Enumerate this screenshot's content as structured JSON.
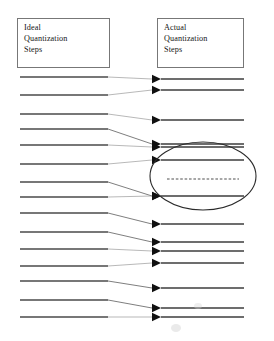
{
  "figure": {
    "width": 274,
    "height": 341,
    "background_color": "#ffffff"
  },
  "boxes": {
    "ideal": {
      "name": "Ideal Quantization Steps",
      "lines": [
        "Ideal",
        "Quantization",
        "Steps"
      ],
      "x": 17,
      "y": 18,
      "width": 93,
      "height": 50,
      "border_color": "#777777"
    },
    "actual": {
      "name": "Actual Quantization Steps",
      "lines": [
        "Actual",
        "Quantization",
        "Steps"
      ],
      "x": 157,
      "y": 18,
      "width": 87,
      "height": 50,
      "border_color": "#777777"
    }
  },
  "chart_data": {
    "type": "diagram",
    "ideal_steps": {
      "label": "Ideal Quantization Steps",
      "x_start": 20,
      "x_end": 108,
      "color": "#4a4a4a",
      "count": 15,
      "y": [
        77,
        95,
        114,
        129,
        145,
        164,
        182,
        197,
        213,
        232,
        249,
        266,
        281,
        300,
        317
      ]
    },
    "actual_steps": {
      "label": "Actual Quantization Steps",
      "x_start": 161,
      "x_end": 244,
      "color": "#3d3d3d",
      "count": 15,
      "y": [
        79,
        90,
        120,
        144,
        147,
        160,
        196,
        224,
        242,
        251,
        263,
        288,
        308,
        317,
        179
      ],
      "dashed_index": 14,
      "dashed_note": "missing code / suppressed step shown as dashed line at y=179"
    },
    "mapping": [
      {
        "from_y": 77,
        "to_y": 79
      },
      {
        "from_y": 95,
        "to_y": 90
      },
      {
        "from_y": 114,
        "to_y": 120
      },
      {
        "from_y": 129,
        "to_y": 144
      },
      {
        "from_y": 145,
        "to_y": 147
      },
      {
        "from_y": 164,
        "to_y": 160
      },
      {
        "from_y": 182,
        "to_y": 196
      },
      {
        "from_y": 197,
        "to_y": 196
      },
      {
        "from_y": 213,
        "to_y": 224
      },
      {
        "from_y": 232,
        "to_y": 242
      },
      {
        "from_y": 249,
        "to_y": 251
      },
      {
        "from_y": 266,
        "to_y": 263
      },
      {
        "from_y": 281,
        "to_y": 288
      },
      {
        "from_y": 300,
        "to_y": 308
      },
      {
        "from_y": 317,
        "to_y": 317
      }
    ],
    "highlight": {
      "shape": "ellipse",
      "center_x": 203,
      "center_y": 176,
      "radius_x": 53,
      "radius_y": 34,
      "stroke_color": "#2b2b2b",
      "note": "region of compressed / missing quantization steps"
    },
    "arrowheads": {
      "color": "#101010",
      "tip_x": 161,
      "size": 9
    }
  }
}
